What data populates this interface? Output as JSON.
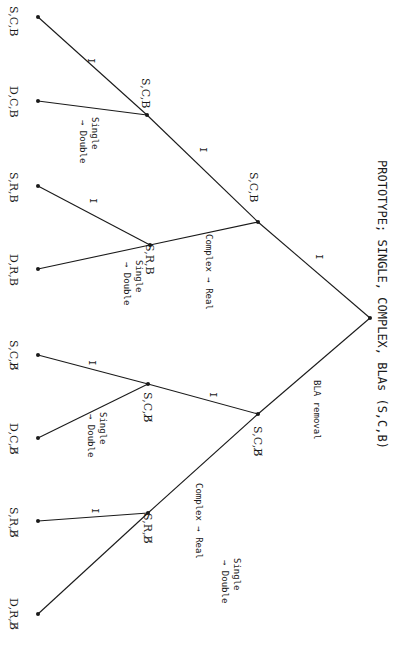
{
  "title": "PROTOTYPE; SINGLE, COMPLEX, BLAs (S,C,B)",
  "root": {
    "x": 370,
    "y": 318
  },
  "nodes": {
    "n_scb_mid": {
      "x": 258,
      "y": 222,
      "label": "S,C,B"
    },
    "n_scb_low": {
      "x": 147,
      "y": 115,
      "label": "S,C,B"
    },
    "n_srb_mid": {
      "x": 150,
      "y": 245,
      "label": "S,R,B"
    },
    "n_scbx_mid": {
      "x": 258,
      "y": 414,
      "label": "S,C,B̸"
    },
    "n_scbx_low": {
      "x": 148,
      "y": 384,
      "label": "S,C,B̸"
    },
    "n_srbx_mid": {
      "x": 148,
      "y": 513,
      "label": "S,R,B̸"
    }
  },
  "leaves": [
    {
      "x": 38,
      "y": 17,
      "label": "S,C,B"
    },
    {
      "x": 38,
      "y": 101,
      "label": "D,C,B"
    },
    {
      "x": 38,
      "y": 186,
      "label": "S,R,B"
    },
    {
      "x": 38,
      "y": 269,
      "label": "D,R,B"
    },
    {
      "x": 38,
      "y": 355,
      "label": "S,C,B̸"
    },
    {
      "x": 38,
      "y": 438,
      "label": "D,C,B̸"
    },
    {
      "x": 38,
      "y": 521,
      "label": "S,R,B̸"
    },
    {
      "x": 38,
      "y": 614,
      "label": "D,R,B̸"
    }
  ],
  "edge_labels": {
    "I": "I",
    "single_double_1": "Single",
    "single_double_2": "→ Double",
    "complex_real": "Complex → Real",
    "bla_removal": "BLA removal"
  }
}
